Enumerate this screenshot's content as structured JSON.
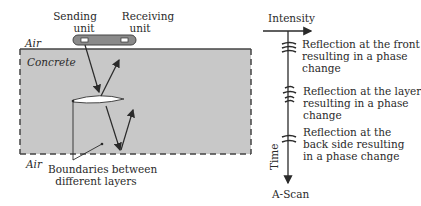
{
  "left_diagram": {
    "sending_unit": [
      "Sending",
      "unit"
    ],
    "receiving_unit": [
      "Receiving",
      "unit"
    ],
    "air_top": "Air",
    "concrete": "Concrete",
    "air_bottom": "Air",
    "boundaries": [
      "Boundaries between",
      "different layers"
    ],
    "colors": {
      "concrete_fill": "#c8c8c8",
      "probe_fill": "#8a8a8a",
      "line": "#2a2a2a"
    }
  },
  "a_scan": {
    "intensity_label": "Intensity",
    "time_label": "Time",
    "title": "A-Scan",
    "reflections": [
      {
        "lines": [
          "Reflection at the front",
          "resulting in a phase",
          "change"
        ]
      },
      {
        "lines": [
          "Reflection at the layer",
          "resulting in a phase",
          "change"
        ]
      },
      {
        "lines": [
          "Reflection at the",
          "back side resulting",
          "in a phase change"
        ]
      }
    ]
  }
}
